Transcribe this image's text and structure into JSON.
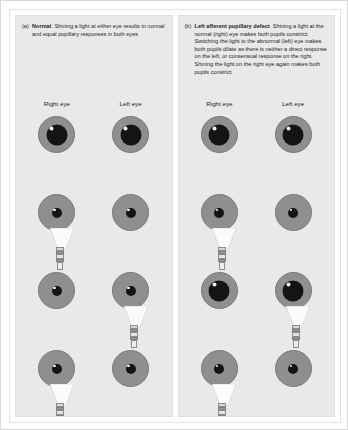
{
  "figure": {
    "background_color": "#ffffff",
    "panel_color": "#e9e9e9",
    "iris_color": "#8f8f8f",
    "pupil_color": "#141414"
  },
  "panels": [
    {
      "marker": "(a)",
      "lead": "Normal",
      "caption_rest": ". Shining a light at either eye results in normal and equal pupillary responses in both eyes",
      "columns": [
        {
          "label": "Right eye"
        },
        {
          "label": "Left eye"
        }
      ],
      "rows": [
        {
          "torch": "none",
          "right_pupil": "dilated",
          "left_pupil": "dilated"
        },
        {
          "torch": "right",
          "right_pupil": "constricted",
          "left_pupil": "constricted"
        },
        {
          "torch": "left",
          "right_pupil": "constricted",
          "left_pupil": "constricted"
        },
        {
          "torch": "right",
          "right_pupil": "constricted",
          "left_pupil": "constricted"
        }
      ]
    },
    {
      "marker": "(b)",
      "lead": "Left afferent pupillary defect",
      "caption_rest": ". Shining a light at the normal (right) eye makes both pupils constrict. Switching the light to the abnormal (left) eye makes both pupils dilate as there is neither a direct response on the left, or consensual response on the right. Shining the light on the right eye again makes both pupils constrict",
      "columns": [
        {
          "label": "Right eye"
        },
        {
          "label": "Left eye"
        }
      ],
      "rows": [
        {
          "torch": "none",
          "right_pupil": "dilated",
          "left_pupil": "dilated"
        },
        {
          "torch": "right",
          "right_pupil": "constricted",
          "left_pupil": "constricted"
        },
        {
          "torch": "left",
          "right_pupil": "dilated",
          "left_pupil": "dilated"
        },
        {
          "torch": "right",
          "right_pupil": "constricted",
          "left_pupil": "constricted"
        }
      ]
    }
  ]
}
